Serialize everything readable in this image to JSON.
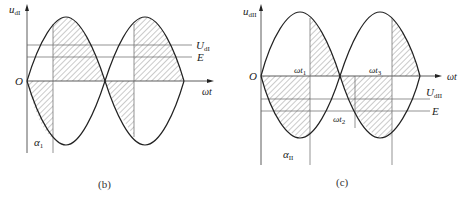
{
  "figure_b": {
    "caption": "(b)",
    "y_label": "u",
    "y_label_sub": "dI",
    "x_label": "ωt",
    "origin": "O",
    "level_1_label": "U",
    "level_1_sub": "dI",
    "level_2_label": "E",
    "angle_label": "α",
    "angle_sub": "1"
  },
  "figure_c": {
    "caption": "(c)",
    "y_label": "u",
    "y_label_sub": "dII",
    "x_label": "ωt",
    "origin": "O",
    "t1_label": "ωt",
    "t1_sub": "1",
    "t2_label": "ωt",
    "t2_sub": "2",
    "t3_label": "ωt",
    "t3_sub": "3",
    "level_1_label": "U",
    "level_1_sub": "dII",
    "level_2_label": "E",
    "angle_label": "α",
    "angle_sub": "II"
  },
  "colors": {
    "stroke": "#222222",
    "hatch": "#555555",
    "thin_line": "#666666"
  }
}
